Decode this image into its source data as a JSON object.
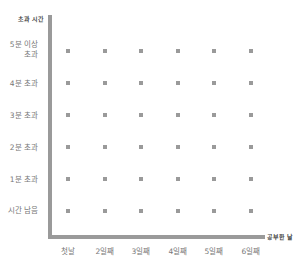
{
  "chart_data": {
    "type": "scatter",
    "title": "",
    "ylabel": "초과 시간",
    "xlabel": "공부한 날",
    "categories": [
      "첫날",
      "2일째",
      "3일째",
      "4일째",
      "5일째",
      "6일째"
    ],
    "y_categories": [
      "시간 남음",
      "1분 초과",
      "2분 초과",
      "3분 초과",
      "4분 초과",
      "5분 이상\n초과"
    ],
    "points": [
      {
        "x": "첫날",
        "y": "5분 이상 초과"
      },
      {
        "x": "2일째",
        "y": "5분 이상 초과"
      },
      {
        "x": "3일째",
        "y": "5분 이상 초과"
      },
      {
        "x": "4일째",
        "y": "5분 이상 초과"
      },
      {
        "x": "5일째",
        "y": "5분 이상 초과"
      },
      {
        "x": "6일째",
        "y": "5분 이상 초과"
      },
      {
        "x": "첫날",
        "y": "4분 초과"
      },
      {
        "x": "2일째",
        "y": "4분 초과"
      },
      {
        "x": "3일째",
        "y": "4분 초과"
      },
      {
        "x": "4일째",
        "y": "4분 초과"
      },
      {
        "x": "5일째",
        "y": "4분 초과"
      },
      {
        "x": "6일째",
        "y": "4분 초과"
      },
      {
        "x": "첫날",
        "y": "3분 초과"
      },
      {
        "x": "2일째",
        "y": "3분 초과"
      },
      {
        "x": "3일째",
        "y": "3분 초과"
      },
      {
        "x": "4일째",
        "y": "3분 초과"
      },
      {
        "x": "5일째",
        "y": "3분 초과"
      },
      {
        "x": "6일째",
        "y": "3분 초과"
      },
      {
        "x": "첫날",
        "y": "2분 초과"
      },
      {
        "x": "2일째",
        "y": "2분 초과"
      },
      {
        "x": "3일째",
        "y": "2분 초과"
      },
      {
        "x": "4일째",
        "y": "2분 초과"
      },
      {
        "x": "5일째",
        "y": "2분 초과"
      },
      {
        "x": "6일째",
        "y": "2분 초과"
      },
      {
        "x": "첫날",
        "y": "1분 초과"
      },
      {
        "x": "2일째",
        "y": "1분 초과"
      },
      {
        "x": "3일째",
        "y": "1분 초과"
      },
      {
        "x": "4일째",
        "y": "1분 초과"
      },
      {
        "x": "5일째",
        "y": "1분 초과"
      },
      {
        "x": "6일째",
        "y": "1분 초과"
      },
      {
        "x": "첫날",
        "y": "시간 남음"
      },
      {
        "x": "2일째",
        "y": "시간 남음"
      },
      {
        "x": "3일째",
        "y": "시간 남음"
      },
      {
        "x": "4일째",
        "y": "시간 남음"
      },
      {
        "x": "5일째",
        "y": "시간 남음"
      },
      {
        "x": "6일째",
        "y": "시간 남음"
      }
    ],
    "grid": false,
    "legend": null,
    "colors": {
      "axis": "#9a9a9a",
      "dot": "#9a9a9a",
      "text": "#777777",
      "title_text": "#444444"
    }
  },
  "axes": {
    "y_title": "초과 시간",
    "x_title": "공부한 날",
    "y_labels": [
      "5분 이상\n초과",
      "4분 초과",
      "3분 초과",
      "2분 초과",
      "1분 초과",
      "시간 남음"
    ],
    "x_labels": [
      "첫날",
      "2일째",
      "3일째",
      "4일째",
      "5일째",
      "6일째"
    ]
  }
}
